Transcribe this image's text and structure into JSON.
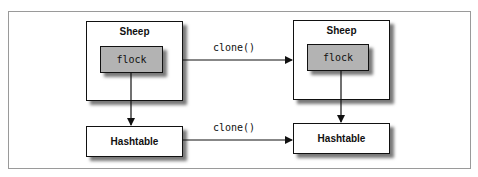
{
  "diagram": {
    "left": {
      "sheep": {
        "title": "Sheep",
        "field": "flock"
      },
      "hashtable": {
        "title": "Hashtable"
      }
    },
    "right": {
      "sheep": {
        "title": "Sheep",
        "field": "flock"
      },
      "hashtable": {
        "title": "Hashtable"
      }
    },
    "edges": {
      "sheep_clone_label": "clone()",
      "hashtable_clone_label": "clone()"
    }
  }
}
